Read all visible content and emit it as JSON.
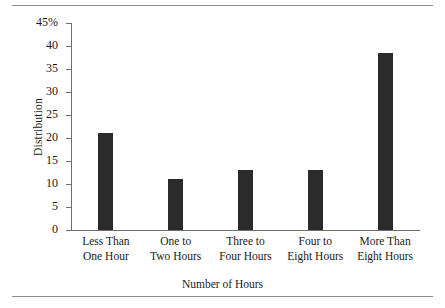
{
  "chart_data": {
    "type": "bar",
    "title": "",
    "xlabel": "Number of Hours",
    "ylabel": "Distribution",
    "categories": [
      "Less Than One Hour",
      "One to Two Hours",
      "Three to Four Hours",
      "Four to Eight Hours",
      "More Than Eight Hours"
    ],
    "category_lines": [
      [
        "Less Than",
        "One Hour"
      ],
      [
        "One to",
        "Two Hours"
      ],
      [
        "Three to",
        "Four Hours"
      ],
      [
        "Four to",
        "Eight Hours"
      ],
      [
        "More Than",
        "Eight Hours"
      ]
    ],
    "values": [
      21,
      11,
      13,
      13,
      38.5
    ],
    "ylim": [
      0,
      45
    ],
    "ytick_values": [
      0,
      5,
      10,
      15,
      20,
      25,
      30,
      35,
      40,
      45
    ],
    "ytick_labels": [
      "0",
      "5",
      "10",
      "15",
      "20",
      "25",
      "30",
      "35",
      "40",
      "45%"
    ],
    "grid": false,
    "legend": "none",
    "bar_color": "#2b2b2b",
    "axis_color": "#6f6f6f",
    "rule_color": "#8d8d8d"
  }
}
